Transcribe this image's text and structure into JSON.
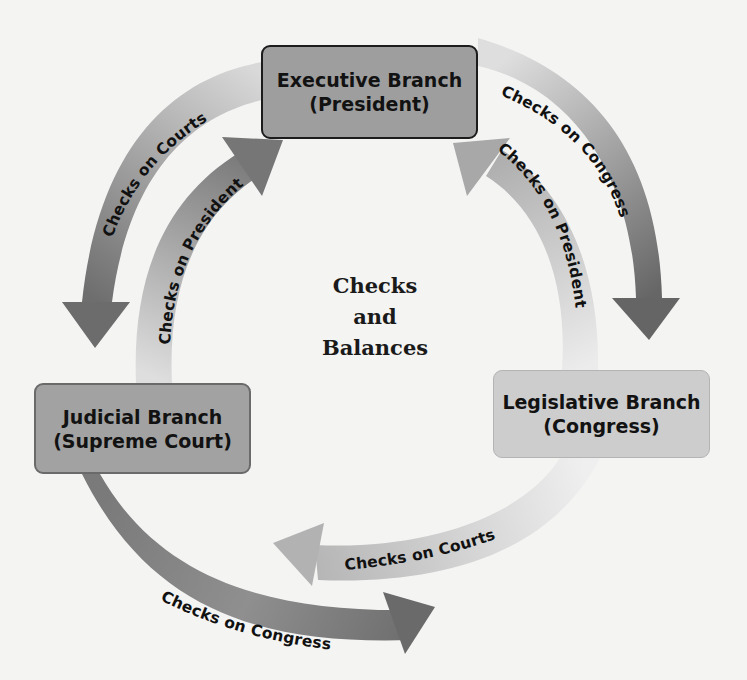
{
  "title": {
    "line1": "Checks",
    "line2": "and",
    "line3": "Balances"
  },
  "branches": {
    "executive": {
      "name": "Executive Branch",
      "sub": "(President)"
    },
    "judicial": {
      "name": "Judicial Branch",
      "sub": "(Supreme Court)"
    },
    "legislative": {
      "name": "Legislative Branch",
      "sub": "(Congress)"
    }
  },
  "arrows": [
    {
      "id": "exec-to-judicial",
      "label": "Checks on Courts",
      "from": "Executive Branch",
      "to": "Judicial Branch"
    },
    {
      "id": "judicial-to-exec",
      "label": "Checks on President",
      "from": "Judicial Branch",
      "to": "Executive Branch"
    },
    {
      "id": "exec-to-legislative",
      "label": "Checks on Congress",
      "from": "Executive Branch",
      "to": "Legislative Branch"
    },
    {
      "id": "legislative-to-exec",
      "label": "Checks on President",
      "from": "Legislative Branch",
      "to": "Executive Branch"
    },
    {
      "id": "legislative-to-judicial",
      "label": "Checks on Courts",
      "from": "Legislative Branch",
      "to": "Judicial Branch"
    },
    {
      "id": "judicial-to-legislative",
      "label": "Checks on Congress",
      "from": "Judicial Branch",
      "to": "Legislative Branch"
    }
  ],
  "colors": {
    "background": "#f4f4f3",
    "executive_box": "#9e9e9e",
    "judicial_box": "#a2a2a2",
    "legislative_box": "#cdcdcd",
    "arrow_dark": "#6e6e6e",
    "arrow_light": "#d6d6d6"
  }
}
